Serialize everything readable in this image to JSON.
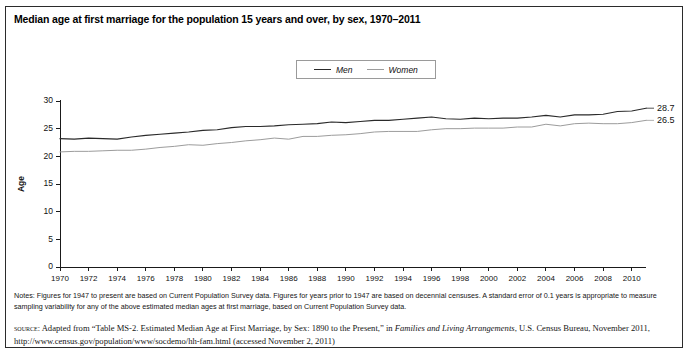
{
  "figure": {
    "title": "Median age at first marriage for the population 15 years and over, by sex, 1970–2011",
    "notes_label": "Notes:",
    "notes": "Notes: Figures for 1947 to present are based on Current Population Survey data. Figures for years prior to 1947 are based on decennial censuses. A standard error of 0.1 years is appropriate to measure sampling variability for any of the above estimated median ages at first marriage, based on Current Population Survey data.",
    "source_prefix": "source:",
    "source_part1": " Adapted from “Table MS-2. Estimated Median Age at First Marriage, by Sex: 1890 to the Present,” in ",
    "source_italic": "Families and Living Arrangements",
    "source_part2": ", U.S. Census Bureau, November 2011, http://www.census.gov/population/www/socdemo/hh-fam.html (accessed November 2, 2011)"
  },
  "colors": {
    "men": "#2a2a2a",
    "women": "#9c9c9c",
    "axis": "#1a1a1a",
    "border": "#2b2b2b"
  },
  "chart_data": {
    "type": "line",
    "title": "Median age at first marriage for the population 15 years and over, by sex, 1970–2011",
    "xlabel": "",
    "ylabel": "Age",
    "xlim": [
      1970,
      2011
    ],
    "ylim": [
      0,
      30
    ],
    "yticks": [
      0,
      5,
      10,
      15,
      20,
      25,
      30
    ],
    "xticks": [
      1970,
      1972,
      1974,
      1976,
      1978,
      1980,
      1982,
      1984,
      1986,
      1988,
      1990,
      1992,
      1994,
      1996,
      1998,
      2000,
      2002,
      2004,
      2006,
      2008,
      2010
    ],
    "grid": false,
    "legend_position": "top-center",
    "x": [
      1970,
      1971,
      1972,
      1973,
      1974,
      1975,
      1976,
      1977,
      1978,
      1979,
      1980,
      1981,
      1982,
      1983,
      1984,
      1985,
      1986,
      1987,
      1988,
      1989,
      1990,
      1991,
      1992,
      1993,
      1994,
      1995,
      1996,
      1997,
      1998,
      1999,
      2000,
      2001,
      2002,
      2003,
      2004,
      2005,
      2006,
      2007,
      2008,
      2009,
      2010,
      2011
    ],
    "series": [
      {
        "name": "Men",
        "color": "#2a2a2a",
        "end_label": "28.7",
        "values": [
          23.2,
          23.1,
          23.3,
          23.2,
          23.1,
          23.5,
          23.8,
          24.0,
          24.2,
          24.4,
          24.7,
          24.8,
          25.2,
          25.4,
          25.4,
          25.5,
          25.7,
          25.8,
          25.9,
          26.2,
          26.1,
          26.3,
          26.5,
          26.5,
          26.7,
          26.9,
          27.1,
          26.8,
          26.7,
          26.9,
          26.8,
          26.9,
          26.9,
          27.1,
          27.4,
          27.1,
          27.5,
          27.5,
          27.6,
          28.1,
          28.2,
          28.7
        ]
      },
      {
        "name": "Women",
        "color": "#9c9c9c",
        "end_label": "26.5",
        "values": [
          20.8,
          20.9,
          20.9,
          21.0,
          21.1,
          21.1,
          21.3,
          21.6,
          21.8,
          22.1,
          22.0,
          22.3,
          22.5,
          22.8,
          23.0,
          23.3,
          23.1,
          23.6,
          23.6,
          23.8,
          23.9,
          24.1,
          24.4,
          24.5,
          24.5,
          24.5,
          24.8,
          25.0,
          25.0,
          25.1,
          25.1,
          25.1,
          25.3,
          25.3,
          25.8,
          25.5,
          25.9,
          26.0,
          25.9,
          25.9,
          26.1,
          26.5
        ]
      }
    ]
  }
}
